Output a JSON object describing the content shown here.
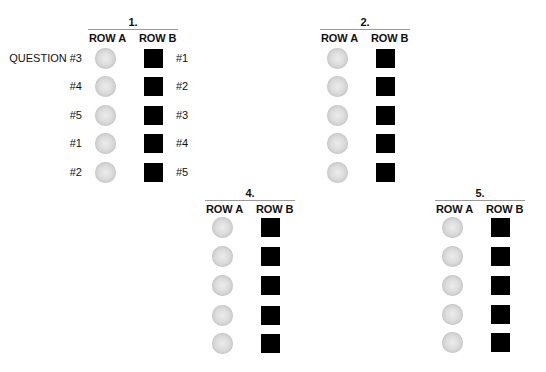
{
  "figure": {
    "clipped_top_text": "",
    "row_a_label": "ROW A",
    "row_b_label": "ROW B",
    "shape_colors": {
      "row_a_circle": "#d4d4d4",
      "row_b_square": "#000000",
      "rule": "#9a9a9a"
    }
  },
  "groups": [
    {
      "title": "1.",
      "left_labels": [
        "QUESTION #3",
        "#4",
        "#5",
        "#1",
        "#2"
      ],
      "right_labels": [
        "#1",
        "#2",
        "#3",
        "#4",
        "#5"
      ],
      "rows": 5
    },
    {
      "title": "2.",
      "left_labels": [],
      "right_labels": [],
      "rows": 5
    },
    {
      "title": "4.",
      "left_labels": [],
      "right_labels": [],
      "rows": 5
    },
    {
      "title": "5.",
      "left_labels": [],
      "right_labels": [],
      "rows": 5
    }
  ]
}
